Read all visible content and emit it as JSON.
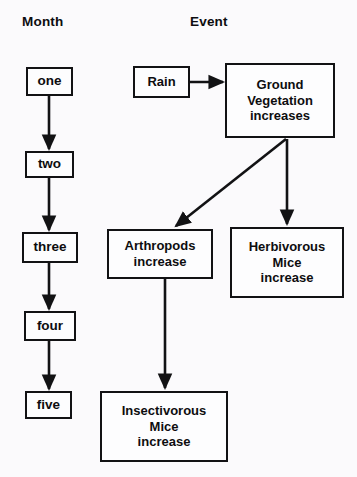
{
  "diagram": {
    "title_columns": [
      {
        "id": "month",
        "label": "Month"
      },
      {
        "id": "event",
        "label": "Event"
      }
    ],
    "month_nodes": [
      {
        "id": "one",
        "label": "one",
        "x": 26,
        "y": 67,
        "w": 47,
        "h": 29
      },
      {
        "id": "two",
        "label": "two",
        "x": 25,
        "y": 151,
        "w": 49,
        "h": 27
      },
      {
        "id": "three",
        "label": "three",
        "x": 22,
        "y": 232,
        "w": 56,
        "h": 31
      },
      {
        "id": "four",
        "label": "four",
        "x": 24,
        "y": 311,
        "w": 52,
        "h": 30
      },
      {
        "id": "five",
        "label": "five",
        "x": 25,
        "y": 391,
        "w": 47,
        "h": 28
      }
    ],
    "event_nodes": [
      {
        "id": "rain",
        "label": "Rain",
        "x": 133,
        "y": 66,
        "w": 57,
        "h": 32
      },
      {
        "id": "ground-vegetation",
        "label": "Ground\nVegetation\nincreases",
        "x": 225,
        "y": 63,
        "w": 110,
        "h": 75
      },
      {
        "id": "arthropods",
        "label": "Arthropods\nincrease",
        "x": 107,
        "y": 229,
        "w": 106,
        "h": 50
      },
      {
        "id": "herbivorous-mice",
        "label": "Herbivorous\nMice\nincrease",
        "x": 230,
        "y": 227,
        "w": 114,
        "h": 71
      },
      {
        "id": "insectivorous-mice",
        "label": "Insectivorous\nMice\nincrease",
        "x": 100,
        "y": 391,
        "w": 128,
        "h": 71
      }
    ],
    "month_edges": [
      {
        "id": "one-to-two",
        "from": "one",
        "to": "two",
        "x1": 49,
        "y1": 96,
        "x2": 49,
        "y2": 149
      },
      {
        "id": "two-to-three",
        "from": "two",
        "to": "three",
        "x1": 49,
        "y1": 178,
        "x2": 49,
        "y2": 230
      },
      {
        "id": "three-to-four",
        "from": "three",
        "to": "four",
        "x1": 49,
        "y1": 263,
        "x2": 49,
        "y2": 309
      },
      {
        "id": "four-to-five",
        "from": "four",
        "to": "five",
        "x1": 49,
        "y1": 341,
        "x2": 49,
        "y2": 389
      }
    ],
    "event_edges": [
      {
        "id": "rain-to-ground",
        "from": "rain",
        "to": "ground-vegetation",
        "x1": 190,
        "y1": 82,
        "x2": 223,
        "y2": 82
      },
      {
        "id": "ground-to-arthropods",
        "from": "ground-vegetation",
        "to": "arthropods",
        "x1": 286,
        "y1": 139,
        "x2": 176,
        "y2": 226
      },
      {
        "id": "ground-to-herbivorous",
        "from": "ground-vegetation",
        "to": "herbivorous-mice",
        "x1": 287,
        "y1": 139,
        "x2": 287,
        "y2": 224
      },
      {
        "id": "arthropods-to-insectivorous",
        "from": "arthropods",
        "to": "insectivorous-mice",
        "x1": 165,
        "y1": 279,
        "x2": 165,
        "y2": 388
      }
    ],
    "colors": {
      "background": "#fbfafc",
      "stroke": "#121214",
      "node_fill": "#fdfdfe",
      "text": "#0d0d0f"
    }
  }
}
